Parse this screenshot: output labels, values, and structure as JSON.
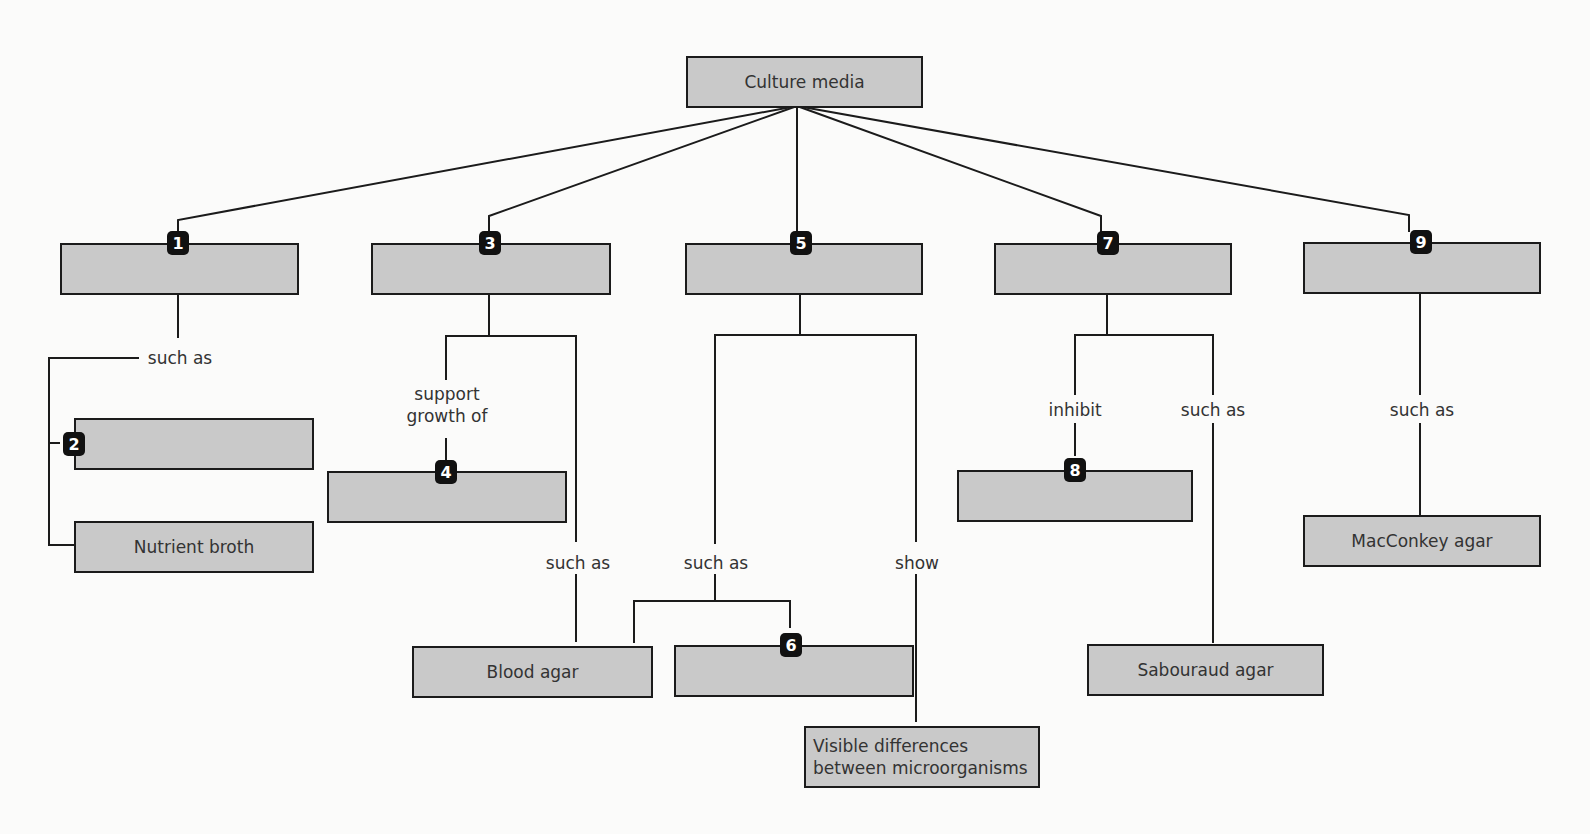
{
  "diagram": {
    "root": {
      "label": "Culture media"
    },
    "categories": [
      {
        "number": "1",
        "label": ""
      },
      {
        "number": "3",
        "label": ""
      },
      {
        "number": "5",
        "label": ""
      },
      {
        "number": "7",
        "label": ""
      },
      {
        "number": "9",
        "label": ""
      }
    ],
    "examples": {
      "n2": {
        "number": "2",
        "label": ""
      },
      "nutrient_broth": {
        "label": "Nutrient broth"
      },
      "n4": {
        "number": "4",
        "label": ""
      },
      "blood_agar": {
        "label": "Blood agar"
      },
      "n6": {
        "number": "6",
        "label": ""
      },
      "visible_differences": {
        "label": "Visible differences between microorganisms",
        "line1": "Visible differences",
        "line2": "between microorganisms"
      },
      "n8": {
        "number": "8",
        "label": ""
      },
      "sabouraud_agar": {
        "label": "Sabouraud agar"
      },
      "macconkey_agar": {
        "label": "MacConkey agar"
      }
    },
    "link_labels": {
      "c1_such_as": "such as",
      "c3_support_growth_of_1": "support",
      "c3_support_growth_of_2": "growth of",
      "c3_such_as": "such as",
      "c5_such_as": "such as",
      "c5_show": "show",
      "c7_inhibit": "inhibit",
      "c7_such_as": "such as",
      "c9_such_as": "such as"
    },
    "colors": {
      "box_fill": "#c9c9c9",
      "box_border": "#1b1b1b",
      "badge_fill": "#111111",
      "badge_text": "#ffffff",
      "line": "#1b1b1b"
    }
  }
}
